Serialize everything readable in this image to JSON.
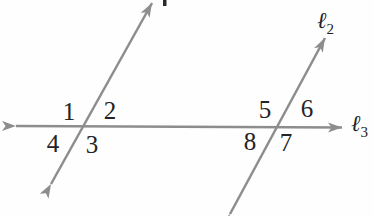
{
  "figure": {
    "angles": [
      "1",
      "2",
      "3",
      "4",
      "5",
      "6",
      "7",
      "8"
    ],
    "line_labels": {
      "l2_base": "ℓ",
      "l2_sub": "2",
      "l3_base": "ℓ",
      "l3_sub": "3"
    }
  },
  "colors": {
    "line": "#8d8d8d",
    "text": "#242424",
    "background": "#fefefe"
  }
}
